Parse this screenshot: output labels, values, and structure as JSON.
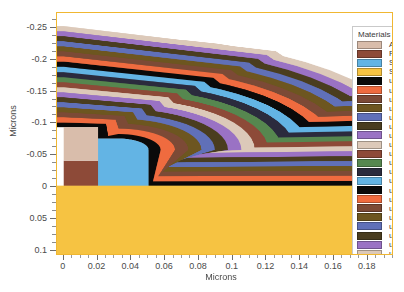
{
  "axes": {
    "xlabel": "Microns",
    "ylabel": "Microns",
    "xticks": [
      "0",
      "0.02",
      "0.04",
      "0.06",
      "0.08",
      "0.1",
      "0.12",
      "0.14",
      "0.16",
      "0.18"
    ],
    "xtick_values": [
      0,
      0.02,
      0.04,
      0.06,
      0.08,
      0.1,
      0.12,
      0.14,
      0.16,
      0.18
    ],
    "yticks": [
      "-0.25",
      "-0.2",
      "-0.15",
      "-0.1",
      "-0.05",
      "0",
      "0.05",
      "0.1"
    ],
    "ytick_values": [
      -0.25,
      -0.2,
      -0.15,
      -0.1,
      -0.05,
      0,
      0.05,
      0.1
    ],
    "xlim": [
      -0.004,
      0.1955
    ],
    "ylim": [
      -0.2735,
      0.1085
    ],
    "y_inverted": true
  },
  "legend": {
    "title": "Materials",
    "items": [
      {
        "label": "Aluminum",
        "color": "#d9bdab"
      },
      {
        "label": "Polysilicon",
        "color": "#8d4a38"
      },
      {
        "label": "SiO2",
        "color": "#63b4e4"
      },
      {
        "label": "Silicon",
        "color": "#f6c342"
      },
      {
        "label": "user 1",
        "color": "#0a0a0a"
      },
      {
        "label": "user 2",
        "color": "#ef6b3f"
      },
      {
        "label": "user 3",
        "color": "#7c4a36"
      },
      {
        "label": "user 4",
        "color": "#6d5620"
      },
      {
        "label": "user 5",
        "color": "#6070b8"
      },
      {
        "label": "user 6",
        "color": "#4a3d1f"
      },
      {
        "label": "user 7",
        "color": "#9a72c4"
      },
      {
        "label": "user 8",
        "color": "#dcc9b9"
      },
      {
        "label": "user 9",
        "color": "#8d4a38"
      },
      {
        "label": "user 10",
        "color": "#56874f"
      },
      {
        "label": "user 11",
        "color": "#2b2b3d"
      },
      {
        "label": "user 12",
        "color": "#63b4e4"
      },
      {
        "label": "user 13",
        "color": "#0a0a0a"
      },
      {
        "label": "user 14",
        "color": "#ef6b3f"
      },
      {
        "label": "user 15",
        "color": "#7c4a36"
      },
      {
        "label": "user 16",
        "color": "#6d5620"
      },
      {
        "label": "user 17",
        "color": "#6070b8"
      },
      {
        "label": "user 18",
        "color": "#4a3d1f"
      },
      {
        "label": "user 19",
        "color": "#9a72c4"
      },
      {
        "label": "user 20",
        "color": "#dcc9b9"
      }
    ]
  },
  "chart_data": {
    "type": "area",
    "title": "",
    "xlabel": "Microns",
    "ylabel": "Microns",
    "xlim": [
      -0.004,
      0.1955
    ],
    "ylim": [
      -0.2735,
      0.1085
    ],
    "grid": false,
    "legend_position": "right-inside",
    "substrate": {
      "name": "Silicon",
      "color": "#f6c342",
      "top_y": 0.0,
      "bottom_y": 0.1085
    },
    "gate_stack": [
      {
        "name": "Polysilicon",
        "color": "#8d4a38",
        "x0": 0.0,
        "x1": 0.0205,
        "y_top": -0.0395,
        "y_bot": 0.0
      },
      {
        "name": "Aluminum",
        "color": "#d9bdab",
        "x0": 0.0,
        "x1": 0.0205,
        "y_top": -0.0925,
        "y_bot": -0.0395
      },
      {
        "name": "SiO2",
        "color": "#63b4e4",
        "x0": 0.0205,
        "x1": 0.0505,
        "y_top": -0.0745,
        "y_bot": 0.0,
        "corner_radius": 0.018
      }
    ],
    "conformal_layers": [
      {
        "order": 1,
        "name": "user 1",
        "color": "#0a0a0a",
        "thickness": 0.0072
      },
      {
        "order": 2,
        "name": "user 2",
        "color": "#ef6b3f",
        "thickness": 0.0085
      },
      {
        "order": 3,
        "name": "user 3",
        "color": "#7c4a36",
        "thickness": 0.008
      },
      {
        "order": 4,
        "name": "user 4",
        "color": "#6d5620",
        "thickness": 0.0078
      },
      {
        "order": 5,
        "name": "user 5",
        "color": "#6070b8",
        "thickness": 0.008
      },
      {
        "order": 6,
        "name": "user 6",
        "color": "#4a3d1f",
        "thickness": 0.0078
      },
      {
        "order": 7,
        "name": "user 7",
        "color": "#9a72c4",
        "thickness": 0.008
      },
      {
        "order": 8,
        "name": "user 8",
        "color": "#dcc9b9",
        "thickness": 0.008
      },
      {
        "order": 9,
        "name": "user 9",
        "color": "#8d4a38",
        "thickness": 0.008
      },
      {
        "order": 10,
        "name": "user 10",
        "color": "#56874f",
        "thickness": 0.008
      },
      {
        "order": 11,
        "name": "user 11",
        "color": "#2b2b3d",
        "thickness": 0.008
      },
      {
        "order": 12,
        "name": "user 12",
        "color": "#63b4e4",
        "thickness": 0.0085
      },
      {
        "order": 13,
        "name": "user 13",
        "color": "#0a0a0a",
        "thickness": 0.0082
      },
      {
        "order": 14,
        "name": "user 14",
        "color": "#ef6b3f",
        "thickness": 0.0082
      },
      {
        "order": 15,
        "name": "user 15",
        "color": "#7c4a36",
        "thickness": 0.008
      },
      {
        "order": 16,
        "name": "user 16",
        "color": "#6d5620",
        "thickness": 0.008
      },
      {
        "order": 17,
        "name": "user 17",
        "color": "#6070b8",
        "thickness": 0.008
      },
      {
        "order": 18,
        "name": "user 18",
        "color": "#4a3d1f",
        "thickness": 0.008
      },
      {
        "order": 19,
        "name": "user 19",
        "color": "#9a72c4",
        "thickness": 0.008
      },
      {
        "order": 20,
        "name": "user 20",
        "color": "#dcc9b9",
        "thickness": 0.0082
      }
    ]
  }
}
